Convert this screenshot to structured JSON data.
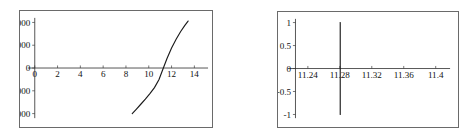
{
  "page": {
    "background_color": "#ffffff",
    "frame_color": "#6a6a6a",
    "axis_color": "#2a2a2a",
    "curve_color": "#1a1a1a"
  },
  "chart_data": [
    {
      "id": "left-plot",
      "type": "line",
      "title": "",
      "xlabel": "",
      "ylabel": "",
      "xlim": [
        -0.6,
        15.2
      ],
      "ylim": [
        -11000,
        11000
      ],
      "grid": false,
      "legend": null,
      "x_ticks": [
        0,
        2,
        4,
        6,
        8,
        10,
        12,
        14
      ],
      "x_tick_labels": [
        "0",
        "2",
        "4",
        "6",
        "8",
        "10",
        "12",
        "14"
      ],
      "y_ticks": [
        10000,
        5000,
        0,
        -5000,
        -10000
      ],
      "y_tick_labels": [
        "10000",
        "5000",
        "0",
        "-5000",
        "-10000"
      ],
      "series": [
        {
          "name": "f(x)",
          "x": [
            8.55,
            8.9,
            9.3,
            9.7,
            10.1,
            10.5,
            10.9,
            11.28,
            11.6,
            12.0,
            12.4,
            12.8,
            13.15,
            13.45
          ],
          "y": [
            -10000,
            -9050,
            -7950,
            -6800,
            -5600,
            -4300,
            -2500,
            0,
            2100,
            4400,
            6300,
            8000,
            9300,
            10300
          ]
        }
      ],
      "annotations": [
        {
          "text": "zero crossing",
          "x": 11.28,
          "y": 0
        }
      ]
    },
    {
      "id": "right-plot",
      "type": "line",
      "title": "",
      "xlabel": "",
      "ylabel": "",
      "xlim": [
        11.215,
        11.418
      ],
      "ylim": [
        -1.08,
        1.08
      ],
      "grid": false,
      "legend": null,
      "x_ticks": [
        11.24,
        11.28,
        11.32,
        11.36,
        11.4
      ],
      "x_tick_labels": [
        "11.24",
        "11.28",
        "11.32",
        "11.36",
        "11.4"
      ],
      "y_ticks": [
        1,
        0.5,
        0,
        -0.5,
        -1
      ],
      "y_tick_labels": [
        "1",
        "0.5",
        "0",
        "-0.5",
        "-1"
      ],
      "series": [
        {
          "name": "f(x)",
          "x": [
            11.2805,
            11.2805
          ],
          "y": [
            -1,
            1
          ]
        }
      ],
      "annotations": [
        {
          "text": "vertical asymptote",
          "x": 11.2805,
          "y": 0
        }
      ]
    }
  ]
}
